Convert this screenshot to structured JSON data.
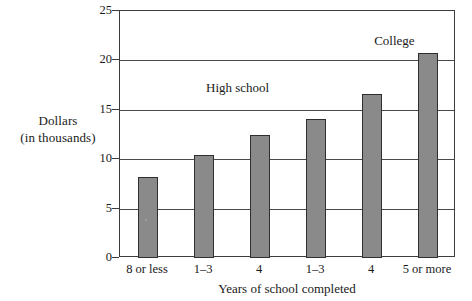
{
  "chart_data": {
    "type": "bar",
    "title": "",
    "subtitle": "",
    "xlabel": "Years of school completed",
    "ylabel": "Dollars",
    "ylabel_line2": "(in thousands)",
    "categories": [
      "8 or less",
      "1–3",
      "4",
      "1–3",
      "4",
      "5 or more"
    ],
    "values": [
      8.2,
      10.4,
      12.4,
      14.1,
      16.6,
      20.7
    ],
    "ylim": [
      0,
      25
    ],
    "yticks": [
      0,
      5,
      10,
      15,
      20,
      25
    ],
    "ytick_labels": [
      "0",
      "5",
      "10",
      "15",
      "20",
      "25"
    ],
    "grid": "horizontal",
    "legend_position": "none",
    "annotations": [
      {
        "text": "High school",
        "x_value": 1.6,
        "y_value": 17.2
      },
      {
        "text": "College",
        "x_value": 4.4,
        "y_value": 22.0
      }
    ],
    "bar_color": "#8a8a8a",
    "bar_edge_color": "#2e2e2e",
    "axis_color": "#3c3c3c",
    "grid_color": "#4a4a4a",
    "background_color": "#ffffff"
  }
}
